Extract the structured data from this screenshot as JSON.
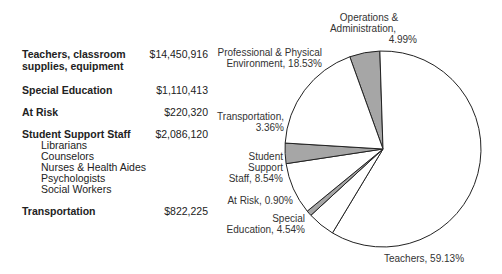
{
  "table": {
    "rows": [
      {
        "label": "Teachers, classroom supplies, equipment",
        "amount": "$14,450,916"
      },
      {
        "label": "Special Education",
        "amount": "$1,110,413"
      },
      {
        "label": "At Risk",
        "amount": "$220,320"
      },
      {
        "label": "Student Support Staff",
        "amount": "$2,086,120",
        "sub_items": [
          "Librarians",
          "Counselors",
          "Nurses & Health Aides",
          "Psychologists",
          "Social Workers"
        ]
      },
      {
        "label": "Transportation",
        "amount": "$822,225"
      }
    ]
  },
  "chart_data": {
    "type": "pie",
    "title": "",
    "labels": [
      "Operations & Administration",
      "Teachers",
      "Special Education",
      "At Risk",
      "Student Support Staff",
      "Transportation",
      "Professional & Physical Environment"
    ],
    "values": [
      4.99,
      59.13,
      4.54,
      0.9,
      8.54,
      3.36,
      18.53
    ],
    "unit": "%",
    "slice_fill": [
      "#a6a6a6",
      "#ffffff",
      "#ffffff",
      "#a6a6a6",
      "#ffffff",
      "#a6a6a6",
      "#ffffff"
    ],
    "data_labels": [
      "Operations & Administration, 4.99%",
      "Teachers, 59.13%",
      "Special Education, 4.54%",
      "At Risk, 0.90%",
      "Student Support Staff, 8.54%",
      "Transportation, 3.36%",
      "Professional & Physical Environment, 18.53%"
    ],
    "legend": "none"
  },
  "labels": {
    "ops1": "Operations &",
    "ops2": "Administration,",
    "ops3": "4.99%",
    "prof1": "Professional & Physical",
    "prof2": "Environment, 18.53%",
    "trans1": "Transportation,",
    "trans2": "3.36%",
    "sss1": "Student",
    "sss2": "Support",
    "sss3": "Staff, 8.54%",
    "risk": "At Risk, 0.90%",
    "sped1": "Special",
    "sped2": "Education, 4.54%",
    "teach": "Teachers, 59.13%"
  }
}
